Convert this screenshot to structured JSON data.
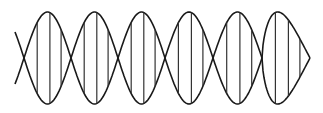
{
  "diagram": {
    "colors": {
      "background": "#ffffff",
      "strand": "#1a1a1a",
      "rung": "#333333"
    },
    "geometry": {
      "center_y": 58,
      "amplitude": 46,
      "crossings_x": [
        24,
        71,
        118,
        165,
        213,
        262
      ],
      "end_x": 310,
      "start_x": 15,
      "rung_offsets_fraction": [
        0.28,
        0.55,
        0.79
      ]
    },
    "strands": [
      {
        "name": "strand-a"
      },
      {
        "name": "strand-b"
      }
    ],
    "lobe_count": 6,
    "rungs_per_lobe": 3
  }
}
